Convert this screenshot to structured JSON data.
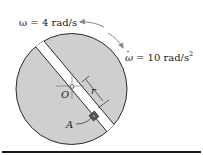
{
  "figure": {
    "omega_label": "ω = 4 rad/s",
    "omega_dot_symbol": "ω",
    "omega_dot_label": "= 10 rad/s",
    "omega_dot_exp": "2",
    "center_label": "O",
    "radius_label": "r",
    "block_label": "A"
  },
  "colors": {
    "disk_fill": "#cfcfcf",
    "slot_fill": "#ffffff",
    "outline": "#2a2a2a",
    "arrow": "#8a8a8a",
    "rule": "#1a1a1a"
  }
}
